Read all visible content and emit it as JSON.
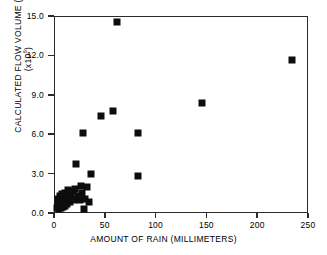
{
  "chart_data": {
    "type": "scatter",
    "title": "",
    "xlabel": "AMOUNT OF RAIN (MILLIMETERS)",
    "ylabel": "CALCULATED FLOW VOLUME (m³)",
    "ylabel_sub": "(x10⁶)",
    "xlim": [
      0,
      250
    ],
    "ylim": [
      0.0,
      15.0
    ],
    "xticks": [
      0,
      50,
      100,
      150,
      200,
      250
    ],
    "xtick_labels": [
      "0",
      "50",
      "100",
      "150",
      "200",
      "250"
    ],
    "yticks": [
      0.0,
      3.0,
      6.0,
      9.0,
      12.0,
      15.0
    ],
    "ytick_labels": [
      "0.0",
      "3.0",
      "6.0",
      "9.0",
      "12.0",
      "15.0"
    ],
    "grid": false,
    "legend": null,
    "marker": "square",
    "marker_color": "#0d0d0d",
    "points": [
      {
        "x": 2,
        "y": 0.3
      },
      {
        "x": 3,
        "y": 0.6
      },
      {
        "x": 3,
        "y": 1.0
      },
      {
        "x": 4,
        "y": 0.2
      },
      {
        "x": 4,
        "y": 0.8
      },
      {
        "x": 5,
        "y": 0.5
      },
      {
        "x": 5,
        "y": 1.2
      },
      {
        "x": 6,
        "y": 0.3
      },
      {
        "x": 6,
        "y": 0.9
      },
      {
        "x": 7,
        "y": 0.6
      },
      {
        "x": 7,
        "y": 1.4
      },
      {
        "x": 8,
        "y": 0.4
      },
      {
        "x": 8,
        "y": 1.0
      },
      {
        "x": 9,
        "y": 0.7
      },
      {
        "x": 10,
        "y": 0.5
      },
      {
        "x": 10,
        "y": 1.5
      },
      {
        "x": 11,
        "y": 0.9
      },
      {
        "x": 12,
        "y": 0.6
      },
      {
        "x": 13,
        "y": 1.7
      },
      {
        "x": 14,
        "y": 1.1
      },
      {
        "x": 15,
        "y": 0.8
      },
      {
        "x": 16,
        "y": 1.3
      },
      {
        "x": 17,
        "y": 1.0
      },
      {
        "x": 18,
        "y": 1.6
      },
      {
        "x": 19,
        "y": 0.9
      },
      {
        "x": 20,
        "y": 1.8
      },
      {
        "x": 21,
        "y": 3.7
      },
      {
        "x": 23,
        "y": 1.2
      },
      {
        "x": 25,
        "y": 0.9
      },
      {
        "x": 26,
        "y": 2.0
      },
      {
        "x": 27,
        "y": 1.5
      },
      {
        "x": 28,
        "y": 6.1
      },
      {
        "x": 29,
        "y": 0.2
      },
      {
        "x": 30,
        "y": 1.0
      },
      {
        "x": 32,
        "y": 1.9
      },
      {
        "x": 34,
        "y": 0.8
      },
      {
        "x": 36,
        "y": 2.9
      },
      {
        "x": 46,
        "y": 7.4
      },
      {
        "x": 58,
        "y": 7.8
      },
      {
        "x": 62,
        "y": 14.6
      },
      {
        "x": 82,
        "y": 6.1
      },
      {
        "x": 82,
        "y": 2.8
      },
      {
        "x": 146,
        "y": 8.4
      },
      {
        "x": 235,
        "y": 11.7
      }
    ]
  }
}
